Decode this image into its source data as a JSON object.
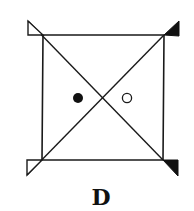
{
  "figure": {
    "label": "D",
    "stroke_color": "#1a1a1a",
    "fill_black": "#111111",
    "fill_white": "#ffffff",
    "square": {
      "top_left": [
        43,
        35
      ],
      "top_right": [
        164,
        35
      ],
      "bottom_right": [
        163,
        160
      ],
      "bottom_left": [
        42,
        160
      ]
    },
    "diagonals": [
      {
        "from": [
          28,
          21
        ],
        "to": [
          163,
          160
        ]
      },
      {
        "from": [
          27,
          175
        ],
        "to": [
          164,
          35
        ]
      }
    ],
    "corner_flags": [
      {
        "position": "top-left",
        "fill": "white",
        "points": [
          [
            28,
            21
          ],
          [
            28,
            35
          ],
          [
            43,
            35
          ]
        ]
      },
      {
        "position": "top-right",
        "fill": "black",
        "points": [
          [
            164,
            35
          ],
          [
            179,
            21
          ],
          [
            179,
            36
          ]
        ]
      },
      {
        "position": "bottom-left",
        "fill": "white",
        "points": [
          [
            42,
            160
          ],
          [
            27,
            160
          ],
          [
            27,
            175
          ]
        ]
      },
      {
        "position": "bottom-right",
        "fill": "black",
        "points": [
          [
            163,
            160
          ],
          [
            178,
            160
          ],
          [
            178,
            176
          ]
        ]
      }
    ],
    "dots": [
      {
        "kind": "filled",
        "center": [
          78,
          98
        ],
        "radius": 5
      },
      {
        "kind": "open",
        "center": [
          127,
          98
        ],
        "radius": 5
      }
    ]
  }
}
